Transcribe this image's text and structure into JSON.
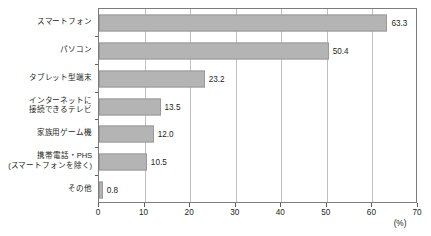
{
  "chart_data": {
    "type": "bar",
    "orientation": "horizontal",
    "title": "",
    "xlabel": "(%)",
    "ylabel": "",
    "xlim": [
      0,
      70
    ],
    "xticks": [
      "0",
      "10",
      "20",
      "30",
      "40",
      "50",
      "60",
      "70"
    ],
    "xtick_values": [
      0,
      10,
      20,
      30,
      40,
      50,
      60,
      70
    ],
    "grid": true,
    "grid_axis": "x",
    "legend": false,
    "categories": [
      "スマートフォン",
      "パソコン",
      "タブレット型端末",
      "インターネットに\n接続できるテレビ",
      "家族用ゲーム機",
      "携帯電話・PHS\n(スマートフォンを除く)",
      "その他"
    ],
    "values": [
      63.3,
      50.4,
      23.2,
      13.5,
      12.0,
      10.5,
      0.8
    ],
    "value_labels": [
      "63.3",
      "50.4",
      "23.2",
      "13.5",
      "12.0",
      "10.5",
      "0.8"
    ],
    "unit": "(%)",
    "colors": {
      "bar_fill": "#b4b4b4",
      "bar_border": "#9a9a9a",
      "gridline": "#bfbfbf",
      "frame": "#7d7d7d",
      "text": "#231f20",
      "background": "#ffffff"
    }
  }
}
